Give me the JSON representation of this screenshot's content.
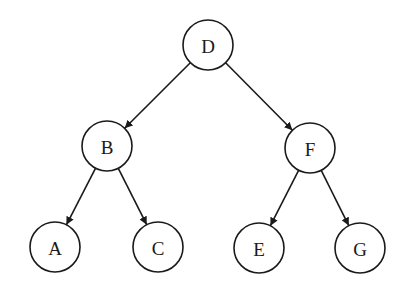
{
  "diagram": {
    "type": "binary-tree",
    "nodes": [
      {
        "id": "D",
        "label": "D",
        "x": 208,
        "y": 45
      },
      {
        "id": "B",
        "label": "B",
        "x": 107,
        "y": 146
      },
      {
        "id": "F",
        "label": "F",
        "x": 310,
        "y": 148
      },
      {
        "id": "A",
        "label": "A",
        "x": 55,
        "y": 247
      },
      {
        "id": "C",
        "label": "C",
        "x": 158,
        "y": 247
      },
      {
        "id": "E",
        "label": "E",
        "x": 259,
        "y": 248
      },
      {
        "id": "G",
        "label": "G",
        "x": 360,
        "y": 248
      }
    ],
    "edges": [
      {
        "from": "D",
        "to": "B"
      },
      {
        "from": "D",
        "to": "F"
      },
      {
        "from": "B",
        "to": "A"
      },
      {
        "from": "B",
        "to": "C"
      },
      {
        "from": "F",
        "to": "E"
      },
      {
        "from": "F",
        "to": "G"
      }
    ],
    "node_radius": 25,
    "colors": {
      "stroke": "#1a1a1a",
      "fill": "#ffffff",
      "background": "#ffffff"
    }
  }
}
